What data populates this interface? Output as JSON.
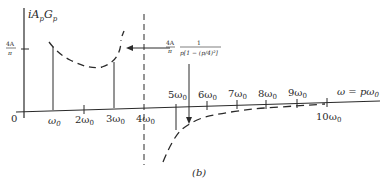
{
  "figure": {
    "caption": "(b)",
    "y_axis_label": {
      "main": "iA",
      "sub1": "p",
      "mid": "G",
      "sub2": "p"
    },
    "y_tick_label": {
      "num": "4A",
      "den": "π"
    },
    "origin_label": "0",
    "x_axis_label": "ω = pω",
    "x_axis_label_sub": "0",
    "x_ticks": [
      {
        "label": "ω",
        "sub": "0"
      },
      {
        "label": "2ω",
        "sub": "0"
      },
      {
        "label": "3ω",
        "sub": "0"
      },
      {
        "label": "4ω",
        "sub": "0"
      },
      {
        "label": "5ω",
        "sub": "0"
      },
      {
        "label": "6ω",
        "sub": "0"
      },
      {
        "label": "7ω",
        "sub": "0"
      },
      {
        "label": "8ω",
        "sub": "0"
      },
      {
        "label": "9ω",
        "sub": "0"
      },
      {
        "label": "10ω",
        "sub": "0"
      }
    ],
    "annotation": {
      "coef_num": "4A",
      "coef_den": "π",
      "frac_num": "1",
      "frac_den": "p[1 − (p/4)²]"
    },
    "colors": {
      "ink": "#2a2a2a",
      "background": "#ffffff"
    }
  }
}
